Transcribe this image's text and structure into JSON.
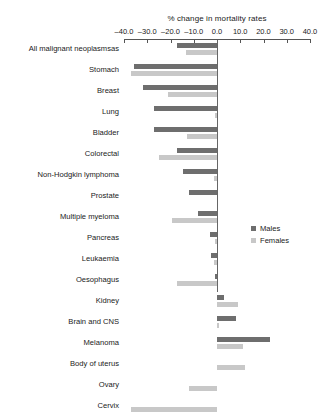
{
  "chart_data": {
    "type": "bar",
    "orientation": "horizontal",
    "title": "% change in mortality rates",
    "xlabel": "% change in mortality rates",
    "ylabel": "",
    "xlim": [
      -40.0,
      40.0
    ],
    "grid": false,
    "legend_position": "right-middle",
    "tick_labels": [
      "-40.0",
      "-30.0",
      "-20.0",
      "-10.0",
      "0.0",
      "10.0",
      "20.0",
      "30.0",
      "40.0"
    ],
    "tick_values": [
      -40,
      -30,
      -20,
      -10,
      0,
      10,
      20,
      30,
      40
    ],
    "categories": [
      "All malignant neoplasmsas",
      "Stomach",
      "Breast",
      "Lung",
      "Bladder",
      "Colorectal",
      "Non-Hodgkin lymphoma",
      "Prostate",
      "Multiple myeloma",
      "Pancreas",
      "Leukaemia",
      "Oesophagus",
      "Kidney",
      "Brain and CNS",
      "Melanoma",
      "Body of uterus",
      "Ovary",
      "Cervix"
    ],
    "series": [
      {
        "name": "Males",
        "color": "#6e6e6e",
        "values": [
          -17.0,
          -35.5,
          -32.0,
          -27.0,
          -27.0,
          -17.0,
          -14.5,
          -12.0,
          -8.0,
          -3.0,
          -2.5,
          -1.0,
          3.0,
          8.0,
          23.0,
          null,
          null,
          null
        ]
      },
      {
        "name": "Females",
        "color": "#c8c8c8",
        "values": [
          -13.5,
          -37.0,
          -21.0,
          -1.0,
          -13.0,
          -25.0,
          -1.5,
          null,
          -19.5,
          -1.0,
          -1.5,
          -17.0,
          9.0,
          1.0,
          11.0,
          12.0,
          -12.0,
          -37.0
        ]
      }
    ]
  },
  "legend": {
    "items": [
      {
        "label": "Males",
        "color": "#6e6e6e"
      },
      {
        "label": "Females",
        "color": "#c8c8c8"
      }
    ]
  }
}
